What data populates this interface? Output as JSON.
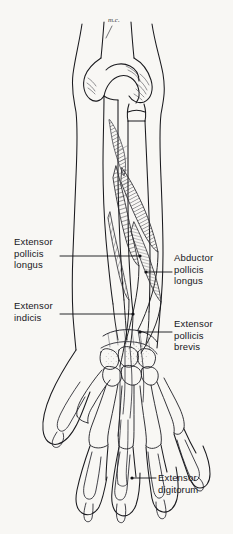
{
  "figure": {
    "background_color": "#f8f7f4",
    "ink_color": "#1a1a1e",
    "annotation": "m.c."
  },
  "labels": [
    {
      "id": "extensor-pollicis-longus",
      "text": "Extensor\npollicis\nlongus",
      "side": "left",
      "x": 14,
      "y": 236,
      "leader": {
        "x1": 60,
        "y1": 256,
        "x2": 140,
        "y2": 256,
        "dot": true
      }
    },
    {
      "id": "extensor-indicis",
      "text": "Extensor\nindicis",
      "side": "left",
      "x": 14,
      "y": 300,
      "leader": {
        "x1": 60,
        "y1": 314,
        "x2": 133,
        "y2": 314,
        "dot": true
      }
    },
    {
      "id": "abductor-pollicis-longus",
      "text": "Abductor\npollicis\nlongus",
      "side": "right",
      "x": 174,
      "y": 252,
      "leader": {
        "x1": 146,
        "y1": 272,
        "x2": 172,
        "y2": 272,
        "dot": true
      }
    },
    {
      "id": "extensor-pollicis-brevis",
      "text": "Extensor\npollicis\nbrevis",
      "side": "right",
      "x": 174,
      "y": 318,
      "leader": {
        "x1": 140,
        "y1": 332,
        "x2": 172,
        "y2": 332,
        "dot": true
      }
    },
    {
      "id": "extensor-digitorum",
      "text": "Extensor\ndigitorum",
      "side": "right",
      "x": 158,
      "y": 472,
      "leader": {
        "x1": 132,
        "y1": 478,
        "x2": 156,
        "y2": 478,
        "dot": true
      }
    }
  ]
}
